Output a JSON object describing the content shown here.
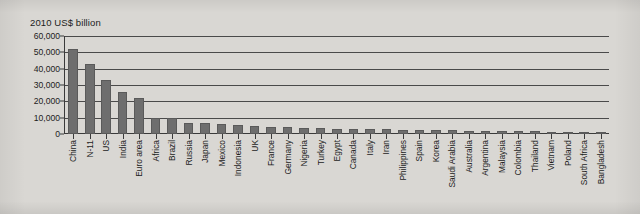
{
  "chart_data": {
    "type": "bar",
    "title": "2010 US$ billion",
    "xlabel": "",
    "ylabel": "",
    "ylim": [
      0,
      60000
    ],
    "yticks": [
      0,
      10000,
      20000,
      30000,
      40000,
      50000,
      60000
    ],
    "ytick_labels": [
      "0",
      "10,000",
      "20,000",
      "30,000",
      "40,000",
      "50,000",
      "60,000"
    ],
    "grid": true,
    "legend": false,
    "bar_color": "#6e6e6e",
    "categories": [
      "China",
      "N-11",
      "US",
      "India",
      "Euro area",
      "Africa",
      "Brazil",
      "Russia",
      "Japan",
      "Mexico",
      "Indonesia",
      "UK",
      "France",
      "Germany",
      "Nigeria",
      "Turkey",
      "Egypt",
      "Canada",
      "Italy",
      "Iran",
      "Philippines",
      "Spain",
      "Korea",
      "Saudi Arabia",
      "Australia",
      "Argentina",
      "Malaysia",
      "Colombia",
      "Thailand",
      "Vietnam",
      "Poland",
      "South Africa",
      "Bangladesh"
    ],
    "values": [
      52000,
      43000,
      33000,
      26000,
      22000,
      10000,
      9500,
      7000,
      6500,
      6000,
      5500,
      5000,
      4200,
      4000,
      3800,
      3500,
      3300,
      3100,
      3000,
      2800,
      2700,
      2500,
      2400,
      2200,
      2000,
      1900,
      1800,
      1700,
      1600,
      1500,
      1400,
      1300,
      1200
    ]
  }
}
